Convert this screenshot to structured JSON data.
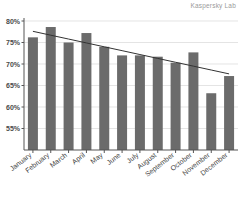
{
  "watermark": "Kaspersky Lab",
  "chart_data": {
    "type": "bar",
    "title": "",
    "subtitle": "",
    "xlabel": "",
    "ylabel": "",
    "categories": [
      "January",
      "February",
      "March",
      "April",
      "May",
      "June",
      "July",
      "August",
      "September",
      "October",
      "November",
      "December"
    ],
    "values": [
      76.2,
      78.6,
      75.0,
      77.2,
      74.0,
      72.0,
      72.0,
      71.7,
      70.3,
      72.7,
      63.2,
      67.2
    ],
    "value_suffix": "%",
    "ylim": [
      50,
      80
    ],
    "ytick_labels": [
      "80%",
      "75%",
      "70%",
      "65%",
      "60%",
      "55%",
      "50%"
    ],
    "ytick_values": [
      80,
      75,
      70,
      65,
      60,
      55,
      50
    ],
    "grid": true,
    "grid_axis": "y",
    "legend": false,
    "legend_position": "none",
    "bar_color": "#6b6b6b",
    "grid_color": "#d8d8d8",
    "axis_color": "#555555",
    "series": [
      {
        "name": "Monthly share",
        "values": [
          76.2,
          78.6,
          75.0,
          77.2,
          74.0,
          72.0,
          72.0,
          71.7,
          70.3,
          72.7,
          63.2,
          67.2
        ]
      },
      {
        "name": "Linear trendline",
        "type": "line",
        "color": "#333333",
        "values": [
          77.6,
          76.7,
          75.8,
          74.9,
          74.0,
          73.1,
          72.2,
          71.3,
          70.4,
          69.5,
          68.6,
          67.7
        ]
      }
    ],
    "annotations": [
      "Kaspersky Lab"
    ]
  }
}
